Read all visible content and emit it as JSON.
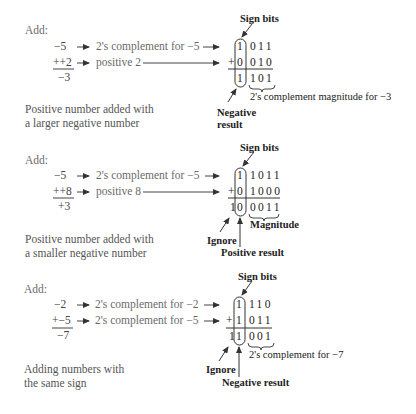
{
  "sections": [
    {
      "add_label": "Add:",
      "rows": [
        {
          "operand": "−5",
          "desc": "2's complement for −5",
          "sign_bit": "1",
          "bits": "011"
        },
        {
          "operand": "++2",
          "desc": "positive 2",
          "sign_bit": "0",
          "bits": "010",
          "op": "+"
        }
      ],
      "result": {
        "decimal": "−3",
        "carry": "",
        "sign_bit": "1",
        "bits": "101"
      },
      "sign_bits_label": "Sign bits",
      "brace_label": "2's complement magnitude for −3",
      "result_label_1": "Negative",
      "result_label_2": "result",
      "caption_1": "Positive number added with",
      "caption_2": "a larger negative number"
    },
    {
      "add_label": "Add:",
      "rows": [
        {
          "operand": "−5",
          "desc": "2's complement for −5",
          "sign_bit": "1",
          "bits": "1011"
        },
        {
          "operand": "++8",
          "desc": "positive 8",
          "sign_bit": "0",
          "bits": "1000",
          "op": "+"
        }
      ],
      "result": {
        "decimal": "+3",
        "carry": "1",
        "sign_bit": "0",
        "bits": "0011"
      },
      "sign_bits_label": "Sign bits",
      "brace_label": "Magnitude",
      "ignore_label": "Ignore",
      "result_label": "Positive result",
      "caption_1": "Positive number added with",
      "caption_2": "a smaller negative number"
    },
    {
      "add_label": "Add:",
      "rows": [
        {
          "operand": "−2",
          "desc": "2's complement for −2",
          "sign_bit": "1",
          "bits": "110"
        },
        {
          "operand": "+−5",
          "desc": "2's complement for −5",
          "sign_bit": "1",
          "bits": "011",
          "op": "+"
        }
      ],
      "result": {
        "decimal": "−7",
        "carry": "1",
        "sign_bit": "1",
        "bits": "001"
      },
      "sign_bits_label": "Sign bits",
      "brace_label": "2's complement for −7",
      "ignore_label": "Ignore",
      "result_label": "Negative result",
      "caption_1": "Adding numbers with",
      "caption_2": "the same sign"
    }
  ]
}
